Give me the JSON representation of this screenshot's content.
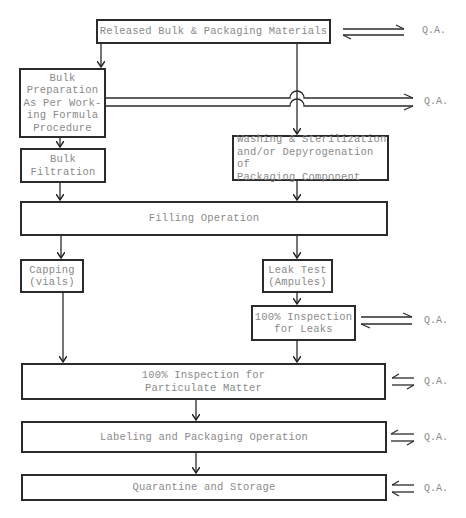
{
  "diagram": {
    "type": "flowchart",
    "nodes": [
      {
        "id": "released",
        "label": "Released Bulk & Packaging Materials"
      },
      {
        "id": "bulk_prep",
        "label": "Bulk\nPreparation\nAs Per Work-\ning Formula\nProcedure"
      },
      {
        "id": "bulk_filtration",
        "label": "Bulk\nFiltration"
      },
      {
        "id": "washing",
        "label": "Washing & Sterilization\nand/or Depyrogenation of\nPackaging Component"
      },
      {
        "id": "filling",
        "label": "Filling Operation"
      },
      {
        "id": "capping",
        "label": "Capping\n(vials)"
      },
      {
        "id": "leak_test",
        "label": "Leak Test\n(Ampules)"
      },
      {
        "id": "inspection_leaks",
        "label": "100% Inspection\nfor Leaks"
      },
      {
        "id": "inspection_particulate",
        "label": "100% Inspection for\nParticulate Matter"
      },
      {
        "id": "labeling",
        "label": "Labeling and Packaging Operation"
      },
      {
        "id": "quarantine",
        "label": "Quarantine and Storage"
      }
    ],
    "qa_labels": [
      {
        "id": "qa_released",
        "label": "Q.A."
      },
      {
        "id": "qa_bulk_prep",
        "label": "Q.A."
      },
      {
        "id": "qa_inspection_leaks",
        "label": "Q.A."
      },
      {
        "id": "qa_inspection_particulate",
        "label": "Q.A."
      },
      {
        "id": "qa_labeling",
        "label": "Q.A."
      },
      {
        "id": "qa_quarantine",
        "label": "Q.A."
      }
    ],
    "edges": [
      {
        "from": "released",
        "to": "bulk_prep"
      },
      {
        "from": "released",
        "to": "washing"
      },
      {
        "from": "bulk_prep",
        "to": "bulk_filtration"
      },
      {
        "from": "bulk_filtration",
        "to": "filling"
      },
      {
        "from": "washing",
        "to": "filling"
      },
      {
        "from": "filling",
        "to": "capping"
      },
      {
        "from": "filling",
        "to": "leak_test"
      },
      {
        "from": "leak_test",
        "to": "inspection_leaks"
      },
      {
        "from": "capping",
        "to": "inspection_particulate"
      },
      {
        "from": "inspection_leaks",
        "to": "inspection_particulate"
      },
      {
        "from": "inspection_particulate",
        "to": "labeling"
      },
      {
        "from": "labeling",
        "to": "quarantine"
      },
      {
        "from": "released",
        "to": "qa_released",
        "bidirectional": true
      },
      {
        "from": "bulk_prep",
        "to": "qa_bulk_prep",
        "double_forward": true
      },
      {
        "from": "inspection_leaks",
        "to": "qa_inspection_leaks",
        "bidirectional": true
      },
      {
        "from": "inspection_particulate",
        "to": "qa_inspection_particulate",
        "bidirectional": true
      },
      {
        "from": "labeling",
        "to": "qa_labeling",
        "bidirectional": true
      },
      {
        "from": "quarantine",
        "to": "qa_quarantine",
        "double_backward": true
      }
    ]
  }
}
